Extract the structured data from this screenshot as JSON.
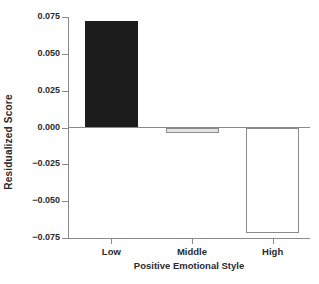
{
  "chart_data": {
    "type": "bar",
    "title": "",
    "xlabel": "Positive Emotional Style",
    "ylabel": "Residualized Score",
    "categories": [
      "Low",
      "Middle",
      "High"
    ],
    "values": [
      0.072,
      -0.0035,
      -0.0715
    ],
    "series": [
      {
        "name": "Residualized Score",
        "values": [
          0.072,
          -0.0035,
          -0.0715
        ]
      }
    ],
    "bar_styles": [
      {
        "category": "Low",
        "fill": "#1c1c1c",
        "edge": "#1c1c1c"
      },
      {
        "category": "Middle",
        "fill": "#e4e4e4",
        "edge": "#8a8a8a"
      },
      {
        "category": "High",
        "fill": "#ffffff",
        "edge": "#8a8a8a"
      }
    ],
    "ylim": [
      -0.075,
      0.075
    ],
    "yticks": [
      0.075,
      0.05,
      0.025,
      0.0,
      -0.025,
      -0.05,
      -0.075
    ],
    "ytick_labels": [
      "0.075",
      "0.050",
      "0.025",
      "0.000",
      "−0.025",
      "−0.050",
      "−0.075"
    ],
    "xtick_labels": [
      "Low",
      "Middle",
      "High"
    ],
    "grid": false,
    "legend": "none",
    "zero_line": true
  }
}
